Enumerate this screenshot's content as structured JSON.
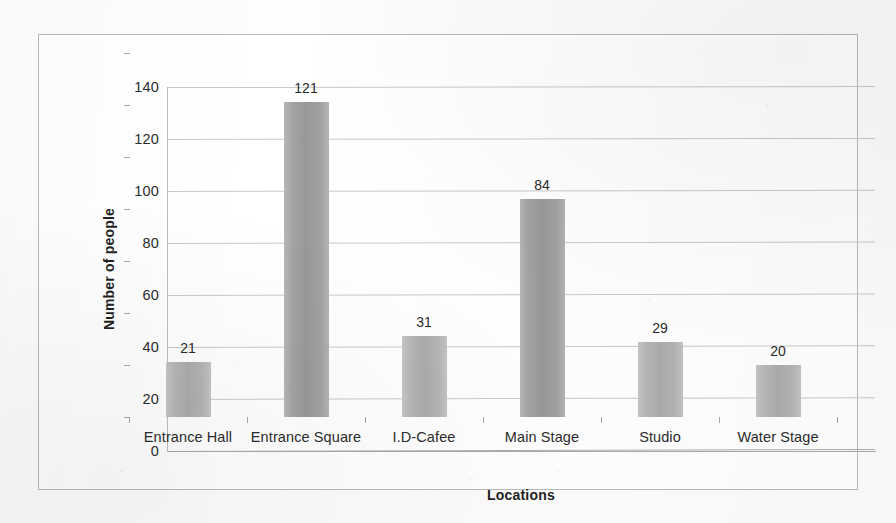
{
  "chart_data": {
    "type": "bar",
    "title": "",
    "subtitle": "",
    "xlabel": "Locations",
    "ylabel": "Number of people",
    "categories": [
      "Entrance Hall",
      "Entrance Square",
      "I.D-Cafee",
      "Main Stage",
      "Studio",
      "Water Stage"
    ],
    "values": [
      21,
      121,
      31,
      84,
      29,
      20
    ],
    "data_labels": [
      "21",
      "121",
      "31",
      "84",
      "29",
      "20"
    ],
    "ylim": [
      0,
      140
    ],
    "ytick_values": [
      0,
      20,
      40,
      60,
      80,
      100,
      120,
      140
    ],
    "ytick_labels": [
      "0",
      "20",
      "40",
      "60",
      "80",
      "100",
      "120",
      "140"
    ],
    "grid": true,
    "grid_axis": "y",
    "legend": false,
    "legend_position": "none",
    "series": [
      {
        "name": "Number of people",
        "values": [
          21,
          121,
          31,
          84,
          29,
          20
        ],
        "color": "#a9a9a9"
      }
    ],
    "colors": {
      "bar_fill": "#a9a9a9",
      "bar_fill_light": "#c6c6c6",
      "gridline": "#c9c9c9",
      "axis": "#a9a9a9",
      "text": "#2c2c2c",
      "frame": "#b9b9b9",
      "background": "#ffffff"
    }
  }
}
